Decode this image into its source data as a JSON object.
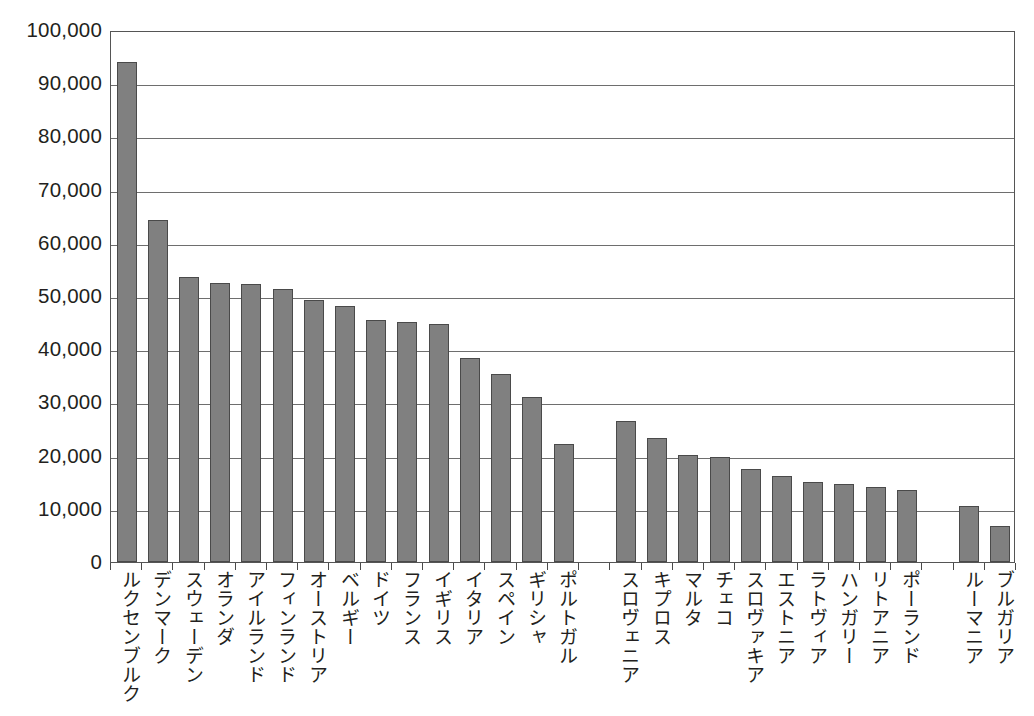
{
  "chart_data": {
    "type": "bar",
    "title": "",
    "subtitle": "",
    "xlabel": "",
    "ylabel": "",
    "ylim": [
      0,
      100000
    ],
    "ytick_step": 10000,
    "grid": true,
    "legend": false,
    "bar_color": "#808080",
    "bar_border_color": "#4a4a4a",
    "axis_color": "#555555",
    "gridline_color": "#6e6e6e",
    "ytick_labels": [
      "100,000",
      "90,000",
      "80,000",
      "70,000",
      "60,000",
      "50,000",
      "40,000",
      "30,000",
      "20,000",
      "10,000",
      "0"
    ],
    "ytick_values": [
      100000,
      90000,
      80000,
      70000,
      60000,
      50000,
      40000,
      30000,
      20000,
      10000,
      0
    ],
    "categories": [
      "ルクセンブルク",
      "デンマーク",
      "スウェーデン",
      "オランダ",
      "アイルランド",
      "フィンランド",
      "オーストリア",
      "ベルギー",
      "ドイツ",
      "フランス",
      "イギリス",
      "イタリア",
      "スペイン",
      "ギリシャ",
      "ポルトガル",
      "",
      "スロヴェニア",
      "キプロス",
      "マルタ",
      "チェコ",
      "スロヴァキア",
      "エストニア",
      "ラトヴィア",
      "ハンガリー",
      "リトアニア",
      "ポーランド",
      "",
      "ルーマニア",
      "ブルガリア"
    ],
    "values": [
      94000,
      64200,
      53500,
      52500,
      52200,
      51400,
      49300,
      48100,
      45400,
      45200,
      44800,
      38300,
      35400,
      31000,
      22200,
      null,
      26600,
      23300,
      20200,
      19800,
      17400,
      16200,
      15000,
      14700,
      14100,
      13500,
      null,
      10600,
      6700
    ]
  }
}
